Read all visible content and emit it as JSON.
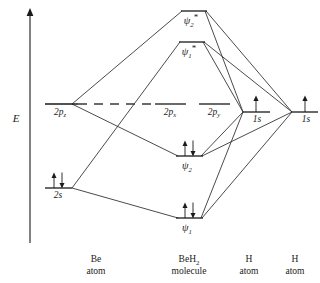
{
  "figure": {
    "kind": "molecular-orbital-energy-level-diagram",
    "system": "BeH2"
  },
  "axis": {
    "label": "E",
    "meaning": "Energy",
    "direction": "up"
  },
  "columns": [
    {
      "id": "be",
      "name": "Be",
      "sub": "",
      "line2": "atom"
    },
    {
      "id": "beh2",
      "name": "BeH",
      "sub": "2",
      "line2": "molecule"
    },
    {
      "id": "h1",
      "name": "H",
      "sub": "",
      "line2": "atom"
    },
    {
      "id": "h2",
      "name": "H",
      "sub": "",
      "line2": "atom"
    }
  ],
  "levels": [
    {
      "id": "psi2-star",
      "column": "beh2",
      "label": "ψ",
      "sub": "2",
      "star": "*",
      "label_pos": "below",
      "electrons": 0,
      "spins": []
    },
    {
      "id": "psi1-star",
      "column": "beh2",
      "label": "ψ",
      "sub": "1",
      "star": "*",
      "label_pos": "below",
      "electrons": 0,
      "spins": []
    },
    {
      "id": "2pz",
      "column": "be",
      "label": "2p",
      "sub": "z",
      "star": "",
      "label_pos": "below",
      "electrons": 0,
      "spins": []
    },
    {
      "id": "2px",
      "column": "beh2",
      "label": "2p",
      "sub": "x",
      "star": "",
      "label_pos": "below",
      "electrons": 0,
      "spins": []
    },
    {
      "id": "2py",
      "column": "beh2",
      "label": "2p",
      "sub": "y",
      "star": "",
      "label_pos": "below",
      "electrons": 0,
      "spins": []
    },
    {
      "id": "1s-h1",
      "column": "h1",
      "label": "1s",
      "sub": "",
      "star": "",
      "label_pos": "below",
      "electrons": 1,
      "spins": [
        "up"
      ]
    },
    {
      "id": "1s-h2",
      "column": "h2",
      "label": "1s",
      "sub": "",
      "star": "",
      "label_pos": "below",
      "electrons": 1,
      "spins": [
        "up"
      ]
    },
    {
      "id": "psi2",
      "column": "beh2",
      "label": "ψ",
      "sub": "2",
      "star": "",
      "label_pos": "below",
      "electrons": 2,
      "spins": [
        "up",
        "down"
      ]
    },
    {
      "id": "2s",
      "column": "be",
      "label": "2s",
      "sub": "",
      "star": "",
      "label_pos": "below",
      "electrons": 2,
      "spins": [
        "up",
        "down"
      ]
    },
    {
      "id": "psi1",
      "column": "beh2",
      "label": "ψ",
      "sub": "1",
      "star": "",
      "label_pos": "below",
      "electrons": 2,
      "spins": [
        "up",
        "down"
      ]
    }
  ],
  "nonbonding_dash": {
    "from_level": "2pz",
    "to_level": "2px",
    "style": "dashed"
  },
  "correlations": [
    {
      "from": "2pz",
      "to": "psi2-star"
    },
    {
      "from": "2pz",
      "to": "psi2"
    },
    {
      "from": "2s",
      "to": "psi1-star"
    },
    {
      "from": "2s",
      "to": "psi1"
    },
    {
      "from": "1s-h1",
      "to": "psi2-star"
    },
    {
      "from": "1s-h1",
      "to": "psi1-star"
    },
    {
      "from": "1s-h1",
      "to": "psi2"
    },
    {
      "from": "1s-h1",
      "to": "psi1"
    },
    {
      "from": "1s-h2",
      "to": "psi2-star"
    },
    {
      "from": "1s-h2",
      "to": "psi1-star"
    },
    {
      "from": "1s-h2",
      "to": "psi2"
    },
    {
      "from": "1s-h2",
      "to": "psi1"
    }
  ],
  "colors": {
    "ink": "#1a1a1a",
    "line": "#2b2b2b",
    "dash": "#3a3a3a",
    "background": "#ffffff"
  }
}
